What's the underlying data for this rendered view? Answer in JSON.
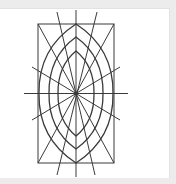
{
  "figure": {
    "stroke_color": "#3a3a3a",
    "center": [
      76,
      93.5
    ],
    "rectangle": {
      "x": 38,
      "y": 24,
      "width": 76,
      "height": 139
    },
    "lenses": [
      {
        "top": 24,
        "bottom": 163,
        "left": 39,
        "right": 113
      },
      {
        "top": 37,
        "bottom": 149,
        "left": 49,
        "right": 103
      },
      {
        "top": 51,
        "bottom": 136,
        "left": 58,
        "right": 94
      }
    ],
    "rays": [
      [
        76,
        10,
        76,
        177
      ],
      [
        24,
        93.5,
        128,
        93.5
      ],
      [
        57,
        12,
        95,
        175
      ],
      [
        97,
        12,
        57,
        175
      ],
      [
        32,
        67,
        120,
        120
      ],
      [
        120,
        67,
        32,
        120
      ],
      [
        38,
        24,
        114,
        163
      ],
      [
        114,
        24,
        38,
        163
      ]
    ]
  }
}
